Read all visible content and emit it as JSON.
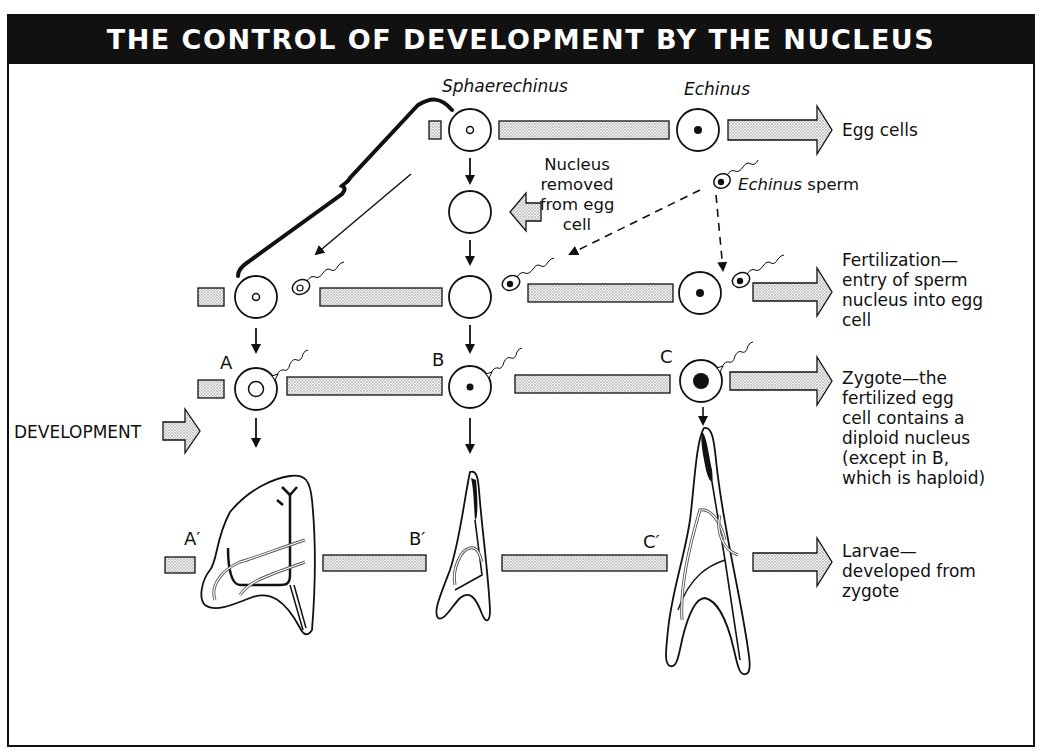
{
  "title": "THE CONTROL OF DEVELOPMENT BY THE NUCLEUS",
  "species": {
    "sphaerechinus": "Sphaerechinus",
    "echinus": "Echinus"
  },
  "annotations": {
    "nucleus_removed": [
      "Nucleus",
      "removed",
      "from egg",
      "cell"
    ],
    "echinus_sperm_italic": "Echinus",
    "echinus_sperm_rest": " sperm",
    "development": "DEVELOPMENT"
  },
  "row_labels": {
    "egg_cells": [
      "Egg cells"
    ],
    "fertilization": [
      "Fertilization—",
      "entry of sperm",
      "nucleus into egg",
      "cell"
    ],
    "zygote": [
      "Zygote—the",
      "fertilized egg",
      "cell contains a",
      "diploid nucleus",
      "(except in B,",
      "which is haploid)"
    ],
    "larvae": [
      "Larvae—",
      "developed from",
      "zygote"
    ]
  },
  "zygote_labels": [
    "A",
    "B",
    "C"
  ],
  "larva_labels": [
    "A′",
    "B′",
    "C′"
  ],
  "colors": {
    "ink": "#111111",
    "stipple_fill": "#dcdcdc",
    "background": "#ffffff"
  }
}
